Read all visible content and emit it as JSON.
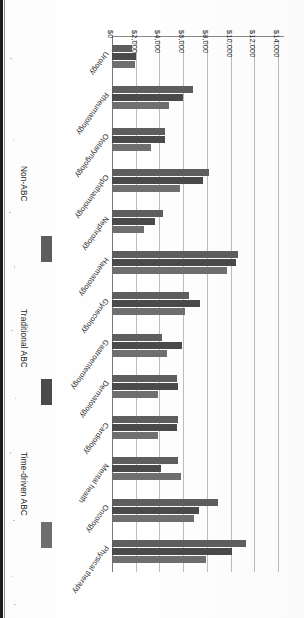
{
  "chart_data": {
    "type": "bar",
    "orientation": "horizontal",
    "title": "",
    "subtitle": "",
    "xlabel": "",
    "ylabel": "",
    "xlim": [
      0,
      14000
    ],
    "x_tick_labels": [
      "$0",
      "$2,000",
      "$4,000",
      "$6,000",
      "$8,000",
      "$10,000",
      "$12,000",
      "$14,000"
    ],
    "x_ticks": [
      0,
      2000,
      4000,
      6000,
      8000,
      10000,
      12000,
      14000
    ],
    "grid": true,
    "grid_axis": "value",
    "legend_position": "right",
    "value_prefix": "$",
    "categories": [
      "Physical therapy",
      "Oncology",
      "Mental health",
      "Cardiology",
      "Dermatology",
      "Gastroenterology",
      "Gynecology",
      "Haematology",
      "Nephrology",
      "Ophthalmology",
      "Otolaryngology",
      "Rheumatology",
      "Urology"
    ],
    "series": [
      {
        "name": "Time-driven ABC",
        "color": "#6f6f6f",
        "values": [
          7900,
          6900,
          5800,
          3900,
          3900,
          4600,
          6200,
          9700,
          2700,
          5700,
          3300,
          4800,
          1900
        ]
      },
      {
        "name": "Traditional ABC",
        "color": "#4a4a4a",
        "values": [
          10100,
          7300,
          4100,
          5500,
          5600,
          5900,
          7400,
          10500,
          3600,
          7700,
          4500,
          6000,
          2000
        ]
      },
      {
        "name": "Non-ABC",
        "color": "#5e5e5e",
        "values": [
          11300,
          8900,
          5600,
          5600,
          5500,
          4200,
          6500,
          10600,
          4300,
          8200,
          4500,
          6800,
          1700
        ]
      }
    ]
  },
  "legend": {
    "items": [
      {
        "label": "Time-driven ABC",
        "swatch_class": "sw-tdabc",
        "color": "#6f6f6f"
      },
      {
        "label": "Traditional ABC",
        "swatch_class": "sw-trad",
        "color": "#4a4a4a"
      },
      {
        "label": "Non-ABC",
        "swatch_class": "sw-non",
        "color": "#5e5e5e"
      }
    ]
  },
  "page": {
    "rotation_degrees": 180,
    "background_color": "#ffffff",
    "gutter_color": "#1b1b1b"
  }
}
